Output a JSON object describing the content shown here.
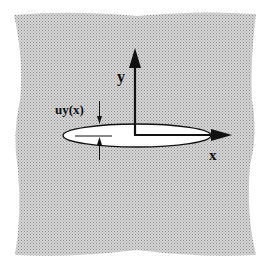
{
  "diagram": {
    "colors": {
      "background": "#ffffff",
      "material": "#c8c8c8",
      "crack_fill": "#ffffff",
      "ink": "#111111"
    },
    "labels": {
      "y_axis": "y",
      "x_axis": "x",
      "displacement": "uy(x)"
    }
  }
}
